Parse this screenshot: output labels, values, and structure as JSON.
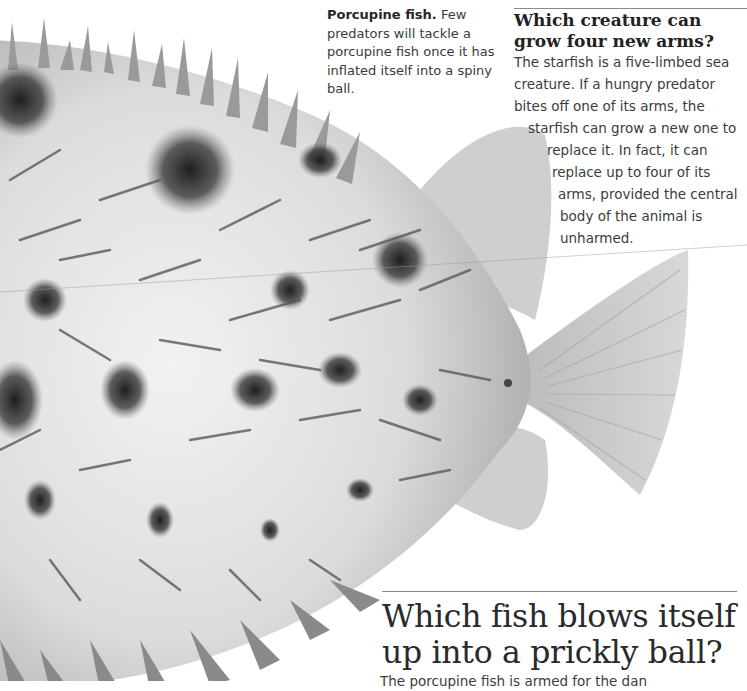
{
  "caption": {
    "lead": "Porcupine fish.",
    "text": "Few predators will tackle a porcupine fish once it has inflated itself into a spiny ball."
  },
  "starfish_section": {
    "title_line1": "Which creature can",
    "title_line2": "grow four new arms?",
    "body_lines": [
      "The starfish is a five-limbed sea",
      "creature. If a hungry predator",
      "bites off one of its arms, the",
      "starfish can grow a new one to",
      "replace it. In fact, it can",
      "replace up to four of its",
      "arms, provided the central",
      "body of the animal is",
      "unharmed."
    ]
  },
  "porcupine_section": {
    "title_line1": "Which fish blows itself",
    "title_line2": "up into a prickly ball?",
    "body_partial": "The porcupine fish is armed for the dan"
  },
  "illustration": {
    "subject": "porcupine-fish",
    "palette": {
      "body_light": "#e8e8e8",
      "body_mid": "#bdbdbd",
      "spot_dark": "#2a2a2a",
      "fin": "#c9c9c9"
    }
  }
}
